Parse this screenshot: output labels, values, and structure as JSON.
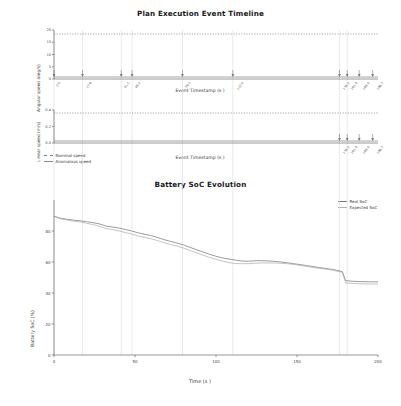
{
  "figure": {
    "timeline_title": "Plan Execution Event Timeline",
    "soc_title": "Battery SoC Evolution"
  },
  "panels": {
    "angular": {
      "ylabel": "Angular speed (deg/s)",
      "xlabel": "Event Timestamp (s )",
      "yticks": [
        "0",
        "5",
        "10",
        "15",
        "20"
      ],
      "event_labels": [
        "0.0",
        "17.6",
        "41.5",
        "48.2",
        "79.3",
        "110.4",
        "176.2",
        "181.0",
        "188.4",
        "196.7"
      ],
      "event_positions": [
        0.0,
        17.6,
        41.5,
        48.2,
        79.3,
        110.4,
        176.2,
        181.0,
        188.4,
        196.7
      ]
    },
    "linear": {
      "ylabel": "Linear speed (m/s)",
      "xlabel": "Event Timestamp (s )",
      "yticks": [
        "0.0",
        "0.2",
        "0.4"
      ],
      "event_labels": [
        "176.2",
        "181.0",
        "188.4",
        "196.7"
      ],
      "event_positions": [
        176.2,
        181.0,
        188.4,
        196.7
      ]
    },
    "speed_legend": [
      {
        "label": "Nominal speed",
        "style": "dashed",
        "color": "#7f7f7f"
      },
      {
        "label": "Anomalous speed",
        "style": "solid",
        "color": "#8a8a8a"
      }
    ]
  },
  "soc_legend": [
    {
      "label": "Real SoC",
      "color": "#7a7a7a"
    },
    {
      "label": "Expected SoC",
      "color": "#b0b0b0"
    }
  ],
  "chart_data": [
    {
      "type": "line",
      "title": "Plan Execution Event Timeline",
      "subplot": "angular-speed-timeline",
      "xlabel": "Event Timestamp (s )",
      "ylabel": "Angular speed (deg/s)",
      "xlim": [
        0,
        200
      ],
      "ylim": [
        0,
        21
      ],
      "grid": false,
      "series": [
        {
          "name": "Nominal speed",
          "style": "dashed",
          "x": [
            0,
            200
          ],
          "values": [
            20,
            20
          ]
        },
        {
          "name": "Anomalous speed",
          "style": "solid",
          "x": [
            0,
            200
          ],
          "values": [
            0,
            0
          ]
        }
      ],
      "event_markers": [
        0.0,
        17.6,
        41.5,
        48.2,
        79.3,
        110.4,
        176.2,
        181.0,
        188.4,
        196.7
      ]
    },
    {
      "type": "line",
      "subplot": "linear-speed-timeline",
      "xlabel": "Event Timestamp (s )",
      "ylabel": "Linear speed (m/s)",
      "xlim": [
        0,
        200
      ],
      "ylim": [
        0,
        0.45
      ],
      "grid": false,
      "series": [
        {
          "name": "Nominal speed",
          "style": "dashed",
          "x": [
            0,
            200
          ],
          "values": [
            0.4,
            0.4
          ]
        },
        {
          "name": "Anomalous speed",
          "style": "solid",
          "x": [
            0,
            200
          ],
          "values": [
            0,
            0
          ]
        }
      ],
      "event_markers": [
        176.2,
        181.0,
        188.4,
        196.7
      ]
    },
    {
      "type": "line",
      "title": "Battery SoC Evolution",
      "xlabel": "Time (s )",
      "ylabel": "Battery SoC (%)",
      "xlim": [
        0,
        200
      ],
      "ylim": [
        0,
        100
      ],
      "xticks": [
        0,
        50,
        100,
        150,
        200
      ],
      "yticks": [
        0,
        20,
        40,
        60,
        80
      ],
      "grid": "vertical",
      "gridlines_x": [
        0,
        17.6,
        41.5,
        48.2,
        79.3,
        110.4,
        176.2,
        181.0
      ],
      "legend_position": "upper right",
      "series": [
        {
          "name": "Real SoC",
          "color": "#7a7a7a",
          "x": [
            0,
            4,
            8,
            12,
            16,
            20,
            24,
            28,
            32,
            36,
            40,
            44,
            48,
            52,
            56,
            60,
            64,
            68,
            72,
            76,
            80,
            84,
            88,
            92,
            96,
            100,
            104,
            108,
            112,
            116,
            120,
            124,
            128,
            132,
            136,
            140,
            144,
            148,
            152,
            156,
            160,
            164,
            168,
            172,
            176,
            178,
            180,
            184,
            188,
            192,
            196,
            200
          ],
          "values": [
            89.5,
            88.2,
            87.6,
            87.0,
            86.6,
            86.0,
            85.4,
            84.6,
            83.2,
            82.6,
            81.9,
            81.0,
            80.0,
            78.8,
            77.9,
            77.0,
            75.8,
            74.4,
            73.3,
            72.2,
            71.0,
            69.4,
            67.9,
            66.4,
            65.0,
            63.7,
            62.6,
            61.9,
            61.2,
            60.6,
            60.5,
            60.8,
            60.9,
            60.7,
            60.4,
            60.0,
            59.5,
            58.9,
            58.3,
            57.7,
            57.0,
            56.4,
            55.8,
            55.2,
            54.3,
            53.8,
            48.0,
            47.6,
            47.4,
            47.3,
            47.2,
            47.2
          ]
        },
        {
          "name": "Expected SoC",
          "color": "#b0b0b0",
          "x": [
            0,
            4,
            8,
            12,
            16,
            20,
            24,
            28,
            32,
            36,
            40,
            44,
            48,
            52,
            56,
            60,
            64,
            68,
            72,
            76,
            80,
            84,
            88,
            92,
            96,
            100,
            104,
            108,
            112,
            116,
            120,
            124,
            128,
            132,
            136,
            140,
            144,
            148,
            152,
            156,
            160,
            164,
            168,
            172,
            176,
            178,
            180,
            184,
            188,
            192,
            196,
            200
          ],
          "values": [
            89.5,
            87.9,
            87.1,
            86.4,
            85.9,
            85.0,
            84.2,
            83.0,
            81.6,
            80.9,
            80.1,
            79.0,
            78.0,
            76.8,
            75.9,
            75.0,
            73.8,
            72.4,
            71.3,
            70.2,
            69.0,
            67.4,
            65.9,
            64.4,
            63.0,
            61.7,
            60.6,
            59.6,
            59.0,
            58.9,
            58.9,
            59.2,
            59.4,
            59.4,
            59.3,
            59.2,
            58.9,
            58.4,
            57.8,
            57.2,
            56.5,
            55.9,
            55.3,
            54.7,
            53.8,
            53.3,
            46.5,
            46.2,
            46.0,
            45.9,
            45.8,
            45.8
          ]
        }
      ]
    }
  ],
  "soc_axis": {
    "ylabel": "Battery SoC (%)",
    "xlabel": "Time (s )",
    "xticks": [
      "0",
      "50",
      "100",
      "150",
      "200"
    ],
    "yticks": [
      "0",
      "20",
      "40",
      "60",
      "80"
    ]
  }
}
